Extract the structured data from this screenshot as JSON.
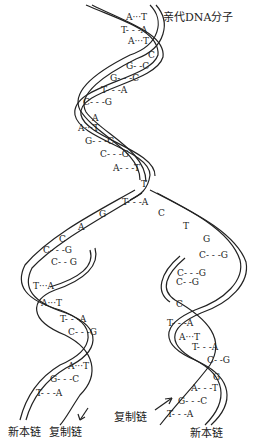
{
  "title": "亲代DNA分子",
  "labels": {
    "new_strand_left": "新本链",
    "template_left": "复制链",
    "template_right": "复制链",
    "new_strand_right": "新本链"
  },
  "parent_pairs": [
    {
      "text": "A···T",
      "x": 126,
      "y": 18
    },
    {
      "text": "T- - -A",
      "x": 121,
      "y": 31
    },
    {
      "text": "A···T",
      "x": 128,
      "y": 42
    },
    {
      "text": "C",
      "x": 148,
      "y": 56
    },
    {
      "text": "G- -C",
      "x": 126,
      "y": 67
    },
    {
      "text": "G- - -C",
      "x": 110,
      "y": 79
    },
    {
      "text": "T- - -A",
      "x": 101,
      "y": 91
    },
    {
      "text": "C- - -G",
      "x": 83,
      "y": 103
    },
    {
      "text": "A",
      "x": 92,
      "y": 119
    },
    {
      "text": "A···T",
      "x": 78,
      "y": 129
    },
    {
      "text": "G- - -C",
      "x": 85,
      "y": 142
    },
    {
      "text": "C- - -G",
      "x": 100,
      "y": 155
    },
    {
      "text": "A- - -T",
      "x": 113,
      "y": 169
    },
    {
      "text": "T",
      "x": 141,
      "y": 185
    }
  ],
  "fork_pairs": [
    {
      "text": "T- - -A",
      "x": 122,
      "y": 203
    },
    {
      "text": "G",
      "x": 99,
      "y": 215
    },
    {
      "text": "A",
      "x": 78,
      "y": 228
    },
    {
      "text": "C",
      "x": 59,
      "y": 240
    },
    {
      "text": "C- - -G",
      "x": 43,
      "y": 251
    },
    {
      "text": "C- - G",
      "x": 51,
      "y": 263
    },
    {
      "text": "C",
      "x": 158,
      "y": 214
    },
    {
      "text": "T",
      "x": 183,
      "y": 227
    },
    {
      "text": "G",
      "x": 203,
      "y": 240
    },
    {
      "text": "C- - -G",
      "x": 199,
      "y": 256
    },
    {
      "text": "C- - -G",
      "x": 177,
      "y": 274
    },
    {
      "text": "C- -G",
      "x": 176,
      "y": 283
    },
    {
      "text": "C",
      "x": 176,
      "y": 305
    }
  ],
  "left_daughter_pairs": [
    {
      "text": "T···A",
      "x": 33,
      "y": 287
    },
    {
      "text": "A···T",
      "x": 41,
      "y": 304
    },
    {
      "text": "T- - -A",
      "x": 60,
      "y": 320
    },
    {
      "text": "C- - -G",
      "x": 68,
      "y": 333
    },
    {
      "text": "A···T",
      "x": 68,
      "y": 367
    },
    {
      "text": "G- - -C",
      "x": 50,
      "y": 380
    },
    {
      "text": "T- - -A",
      "x": 36,
      "y": 394
    }
  ],
  "right_daughter_pairs": [
    {
      "text": "T- - -A",
      "x": 167,
      "y": 324
    },
    {
      "text": "A···T",
      "x": 179,
      "y": 338
    },
    {
      "text": "T- - -A",
      "x": 192,
      "y": 348
    },
    {
      "text": "C- -G",
      "x": 207,
      "y": 361
    },
    {
      "text": "G",
      "x": 213,
      "y": 378
    },
    {
      "text": "A- - -T",
      "x": 191,
      "y": 389
    },
    {
      "text": "G- - -C",
      "x": 178,
      "y": 402
    },
    {
      "text": "T- - -A",
      "x": 167,
      "y": 415
    }
  ]
}
